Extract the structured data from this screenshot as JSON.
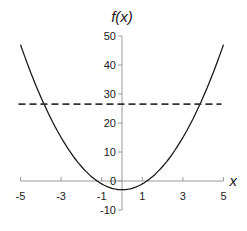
{
  "chart_data": {
    "type": "line",
    "title": "",
    "xlabel": "x",
    "ylabel": "f(x)",
    "xlim": [
      -5,
      5
    ],
    "ylim": [
      -10,
      50
    ],
    "x_ticks": [
      "-5",
      "-3",
      "-1",
      "1",
      "3",
      "5"
    ],
    "y_ticks": [
      "50",
      "40",
      "30",
      "20",
      "10",
      "0",
      "-10"
    ],
    "grid": false,
    "legend": null,
    "series": [
      {
        "name": "f(x)",
        "style": "solid",
        "x": [
          -5,
          -4,
          -3,
          -2,
          -1,
          0,
          1,
          2,
          3,
          4,
          5
        ],
        "values": [
          47,
          29,
          15,
          5,
          -1,
          -3,
          -1,
          5,
          15,
          29,
          47
        ]
      },
      {
        "name": "horizontal line",
        "style": "dashed",
        "x": [
          -5.1,
          4.9
        ],
        "values": [
          26.5,
          26.5
        ]
      }
    ]
  },
  "labels": {
    "y_axis_title": "f(x)",
    "x_axis_title": "x"
  }
}
